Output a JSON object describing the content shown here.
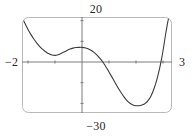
{
  "figure": {
    "kind": "graphing-calculator-window",
    "frame": {
      "stroke_color": "#b5b5b5",
      "corner_radius_px": 6,
      "left_px": 22,
      "top_px": 17,
      "right_px": 172,
      "bottom_px": 113
    },
    "axes": {
      "stroke_color": "#6e6e6e",
      "x_axis_y_px": 62,
      "y_axis_x_px": 82,
      "tick_len_px": 3
    },
    "curve": {
      "stroke_color": "#3a3a3a",
      "stroke_width_px": 1.1
    }
  },
  "labels": {
    "y_max": "20",
    "y_min": "−30",
    "x_min": "−2",
    "x_max": "3"
  },
  "chart_data": {
    "type": "line",
    "title": "",
    "xlabel": "",
    "ylabel": "",
    "xlim": [
      -2,
      3
    ],
    "ylim": [
      -30,
      20
    ],
    "grid": false,
    "legend": false,
    "legend_position": "none",
    "axis_tick_labels": {
      "x": [
        "−2",
        "3"
      ],
      "y": [
        "−30",
        "20"
      ]
    },
    "x_tick_values": [
      -2,
      -1,
      0,
      1,
      2,
      3
    ],
    "y_tick_values": [
      -30,
      -20,
      -10,
      0,
      10,
      20
    ],
    "annotations": [],
    "series": [
      {
        "name": "curve",
        "description": "quartic polynomial; local minimum tangent to x-axis near x = -1, local maximum just above y = 0 near x = 0, global minimum near x = 2.1, steeply increasing at both window edges",
        "x": [
          -2.0,
          -1.9,
          -1.8,
          -1.7,
          -1.6,
          -1.5,
          -1.4,
          -1.3,
          -1.2,
          -1.1,
          -1.0,
          -0.9,
          -0.8,
          -0.7,
          -0.6,
          -0.5,
          -0.4,
          -0.3,
          -0.2,
          -0.1,
          0.0,
          0.1,
          0.2,
          0.3,
          0.4,
          0.5,
          0.6,
          0.7,
          0.8,
          0.9,
          1.0,
          1.1,
          1.2,
          1.3,
          1.4,
          1.5,
          1.6,
          1.7,
          1.8,
          1.9,
          2.0,
          2.1,
          2.2,
          2.3,
          2.4,
          2.5,
          2.6,
          2.7,
          2.8,
          2.9,
          3.0
        ],
        "y": [
          20.0,
          16.6,
          13.5,
          10.8,
          8.4,
          6.3,
          4.5,
          3.0,
          1.8,
          0.8,
          0.2,
          0.0,
          0.3,
          1.0,
          1.8,
          2.6,
          3.3,
          3.8,
          4.1,
          4.2,
          4.2,
          4.0,
          3.5,
          2.7,
          1.6,
          0.2,
          -1.5,
          -3.6,
          -6.0,
          -8.6,
          -11.3,
          -14.1,
          -16.8,
          -19.3,
          -21.6,
          -23.5,
          -24.9,
          -25.8,
          -26.2,
          -26.2,
          -25.8,
          -25.1,
          -23.6,
          -21.1,
          -17.4,
          -12.4,
          -5.9,
          2.3,
          12.2,
          20.0,
          20.0
        ],
        "key_points": [
          {
            "name": "local-minimum-tangent-to-x-axis",
            "x": -0.95,
            "y": 0.0
          },
          {
            "name": "local-maximum",
            "x": -0.02,
            "y": 4.2
          },
          {
            "name": "x-intercept-left-of-local-max",
            "x": 0.52,
            "y": 0.0
          },
          {
            "name": "global-minimum",
            "x": 1.85,
            "y": -26.2
          },
          {
            "name": "x-intercept-right",
            "x": 2.68,
            "y": 0.0
          }
        ]
      }
    ]
  }
}
